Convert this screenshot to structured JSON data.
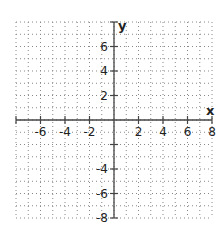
{
  "diagram": {
    "type": "coordinate-plane",
    "x_axis": {
      "label": "x",
      "min": -8,
      "max": 8,
      "tick_step": 2,
      "tick_labels": [
        "-6",
        "-4",
        "-2",
        "2",
        "4",
        "6",
        "8"
      ]
    },
    "y_axis": {
      "label": "y",
      "min": -8,
      "max": 8,
      "tick_step": 2,
      "tick_labels": [
        "6",
        "4",
        "2",
        "-4",
        "-6",
        "-8"
      ]
    },
    "grid": {
      "step": 1,
      "style": "dotted"
    },
    "colors": {
      "axis": "#444444",
      "grid": "#888888",
      "text": "#222222"
    }
  }
}
